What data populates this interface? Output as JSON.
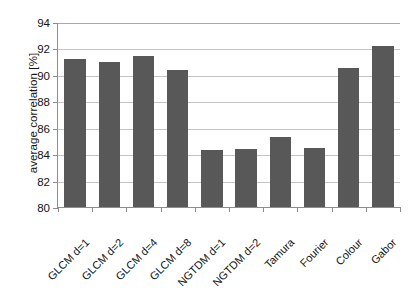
{
  "chart_data": {
    "type": "bar",
    "title": "",
    "xlabel": "",
    "ylabel": "average correlation [%]",
    "ylim": [
      80,
      94
    ],
    "yticks": [
      80,
      82,
      84,
      86,
      88,
      90,
      92,
      94
    ],
    "ytick_labels": [
      "80",
      "82",
      "84",
      "86",
      "88",
      "90",
      "92",
      "94"
    ],
    "grid": true,
    "legend": false,
    "bar_color": "#585858",
    "gridline_color": "#c4c4c4",
    "axis_color": "#8d8d8d",
    "background_color": "#ffffff",
    "categories": [
      "GLCM d=1",
      "GLCM d=2",
      "GLCM d=4",
      "GLCM d=8",
      "NGTDM d=1",
      "NGTDM d=2",
      "Tamura",
      "Fourier",
      "Colour",
      "Gabor"
    ],
    "values": [
      91.2,
      91.0,
      91.4,
      90.4,
      84.3,
      84.4,
      85.3,
      84.5,
      90.5,
      92.2
    ]
  },
  "axis": {
    "y_title": "average correlation [%]"
  }
}
